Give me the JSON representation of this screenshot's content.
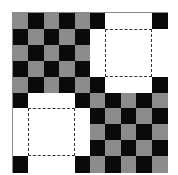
{
  "diagram": {
    "title": "",
    "rows": 10,
    "cols": 10,
    "legend": {
      "G": "gray square",
      "B": "black square",
      "W": "removed (white) square"
    },
    "colors": {
      "G": "#8c8c8c",
      "B": "#0a0a0a",
      "W": "#ffffff",
      "border": "#8a8a8a",
      "dash": "#333333"
    },
    "grid": [
      "GBGBGBWWWB",
      "BGBGBWWWWW",
      "GBGBGWWWWW",
      "BGBGBWWWWW",
      "GBGBGBWWWB",
      "BWWWBGBGBG",
      "WWWWWBGBGB",
      "WWWWWGBGBG",
      "WWWWWBGBGB",
      "BWWWBGBGBG"
    ],
    "dashed_regions": [
      {
        "name": "upper-right-dashed-square",
        "row_start": 1,
        "col_start": 6,
        "row_span": 3,
        "col_span": 3
      },
      {
        "name": "lower-left-dashed-square",
        "row_start": 6,
        "col_start": 1,
        "row_span": 3,
        "col_span": 3
      }
    ]
  }
}
